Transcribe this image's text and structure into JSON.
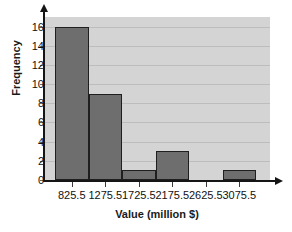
{
  "chart_data": {
    "type": "bar",
    "title": "",
    "subtitle": "",
    "xlabel": "Value (million $)",
    "ylabel": "Frequency",
    "categories": [
      "825.5",
      "1275.5",
      "1725.5",
      "2175.5",
      "2625.5",
      "3075.5"
    ],
    "values": [
      16,
      9,
      1,
      3,
      0,
      1
    ],
    "series": [
      {
        "name": "Frequency",
        "values": [
          16,
          9,
          1,
          3,
          0,
          1
        ]
      }
    ],
    "ylim": [
      0,
      17
    ],
    "ytick_labels": [
      "0",
      "2",
      "4",
      "6",
      "8",
      "10",
      "12",
      "14",
      "16"
    ],
    "ytick_values": [
      0,
      2,
      4,
      6,
      8,
      10,
      12,
      14,
      16
    ],
    "xtick_labels": [
      "825.5",
      "1275.5",
      "1725.5",
      "2175.5",
      "2625.5",
      "3075.5"
    ],
    "grid": true,
    "grid_axis": "y",
    "legend": "none",
    "bar_color": "#6e6e6e",
    "bar_edge_color": "#1f1f1f",
    "plot_background": "#d4d4d4",
    "gridline_color": "#bdbdbd",
    "axis_color": "#151515",
    "figure_background": "#ffffff",
    "bin_width": 450,
    "bars_contiguous": true,
    "x_axis_has_arrow": true,
    "y_axis_has_arrow": true
  }
}
